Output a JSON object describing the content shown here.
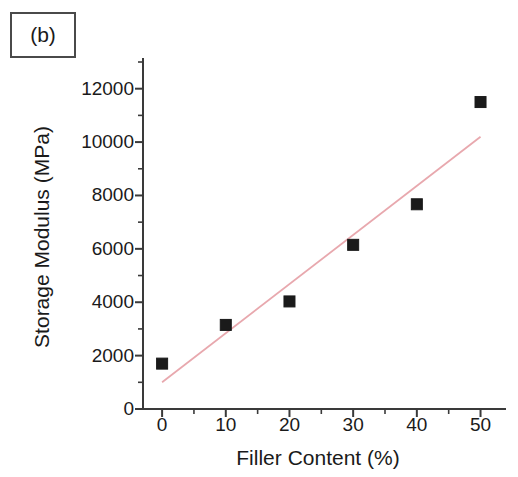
{
  "panel": {
    "label": "(b)"
  },
  "chart_data": {
    "type": "scatter",
    "title": "",
    "panel_label": "(b)",
    "xlabel": "Filler Content (%)",
    "ylabel": "Storage Modulus (MPa)",
    "x": [
      0,
      10,
      20,
      30,
      40,
      50
    ],
    "values": [
      1700,
      3150,
      4030,
      6150,
      7670,
      11500
    ],
    "series": [
      {
        "name": "Storage Modulus",
        "marker": "filled-square",
        "marker_color": "#1a1a1a",
        "x": [
          0,
          10,
          20,
          30,
          40,
          50
        ],
        "values": [
          1700,
          3150,
          4030,
          6150,
          7670,
          11500
        ]
      },
      {
        "name": "Linear fit",
        "type": "line",
        "color": "#e8a8ae",
        "x": [
          0,
          50
        ],
        "values": [
          1000,
          10200
        ]
      }
    ],
    "xlim": [
      -3,
      54
    ],
    "ylim": [
      0,
      13000
    ],
    "xticks": [
      0,
      10,
      20,
      30,
      40,
      50
    ],
    "xtick_labels": [
      "0",
      "10",
      "20",
      "30",
      "40",
      "50"
    ],
    "yticks": [
      0,
      2000,
      4000,
      6000,
      8000,
      10000,
      12000
    ],
    "ytick_labels": [
      "0",
      "2000",
      "4000",
      "6000",
      "8000",
      "10000",
      "12000"
    ],
    "minor_ticks": true,
    "x_minor_ticks": [
      5,
      15,
      25,
      35,
      45
    ],
    "y_minor_ticks": [
      1000,
      3000,
      5000,
      7000,
      9000,
      11000,
      13000
    ],
    "grid": false,
    "legend": null,
    "spines": [
      "left",
      "bottom"
    ],
    "tick_direction": "out",
    "axis_color": "#3a3a3a",
    "background": "#ffffff"
  }
}
